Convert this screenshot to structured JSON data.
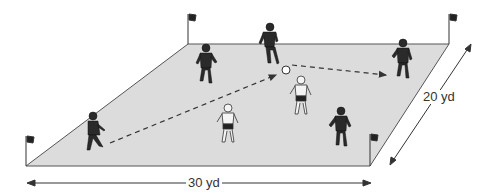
{
  "diagram": {
    "field": {
      "width_label": "30 yd",
      "depth_label": "20 yd",
      "fill": "#dcdcdc",
      "stroke": "#555555"
    },
    "corners": [
      {
        "name": "flag-bottom-left",
        "x": 26,
        "y": 166
      },
      {
        "name": "flag-top-left",
        "x": 188,
        "y": 44
      },
      {
        "name": "flag-top-right",
        "x": 449,
        "y": 44
      },
      {
        "name": "flag-bottom-right",
        "x": 370,
        "y": 166
      }
    ],
    "players": [
      {
        "team": "dark",
        "x": 93,
        "y": 138
      },
      {
        "team": "dark",
        "x": 206,
        "y": 65
      },
      {
        "team": "dark",
        "x": 270,
        "y": 45
      },
      {
        "team": "dark",
        "x": 403,
        "y": 60
      },
      {
        "team": "dark",
        "x": 341,
        "y": 128
      },
      {
        "team": "light",
        "x": 228,
        "y": 125
      },
      {
        "team": "light",
        "x": 301,
        "y": 97
      }
    ],
    "ball": {
      "x": 286,
      "y": 70
    },
    "passes": [
      {
        "from": [
          110,
          143
        ],
        "to": [
          280,
          73
        ]
      },
      {
        "from": [
          292,
          65
        ],
        "to": [
          387,
          75
        ]
      }
    ]
  }
}
